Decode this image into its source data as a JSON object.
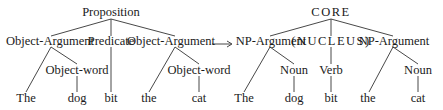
{
  "left_tree": {
    "root": "Proposition",
    "level1": [
      "Object-Argument",
      "Predicate",
      "Object-Argument"
    ],
    "level2": [
      "Object-word",
      "Object-word"
    ],
    "leaves": [
      "The",
      "dog",
      "bit",
      "the",
      "cat"
    ]
  },
  "right_tree": {
    "root": "CORE",
    "level1": [
      "NP-Argument",
      "(NUCLEUS)",
      "NP-Argument"
    ],
    "level2": [
      "Noun",
      "Verb",
      "Noun"
    ],
    "leaves": [
      "The",
      "dog",
      "bit",
      "the",
      "cat"
    ]
  },
  "arrow": {
    "direction": "right",
    "meaning": "maps-to"
  },
  "colors": {
    "line": "#333333",
    "text": "#1a1a1a",
    "background": "#ffffff"
  }
}
